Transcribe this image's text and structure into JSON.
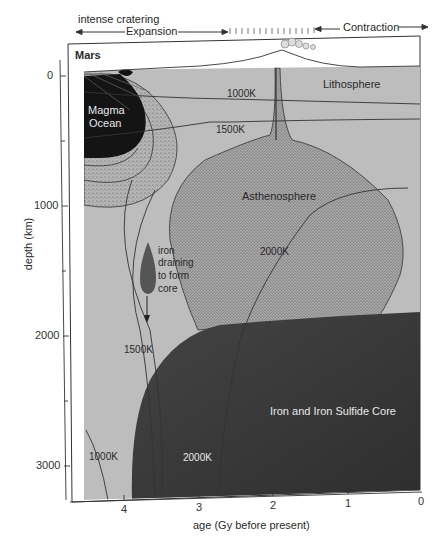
{
  "figure": {
    "title": "Mars",
    "top_annotations": {
      "cratering": "intense cratering",
      "expansion": "Expansion",
      "contraction": "Contraction"
    },
    "regions": {
      "magma_ocean_line1": "Magma",
      "magma_ocean_line2": "Ocean",
      "lithosphere": "Lithosphere",
      "asthenosphere": "Asthenosphere",
      "core": "Iron and Iron Sulfide Core",
      "iron_line1": "iron",
      "iron_line2": "draining",
      "iron_line3": "to form",
      "iron_line4": "core"
    },
    "isotherms": {
      "k1000_top": "1000K",
      "k1500_top": "1500K",
      "k2000_mid": "2000K",
      "k1500_low": "1500K",
      "k1000_low": "1000K",
      "k2000_low": "2000K"
    },
    "y_axis": {
      "label": "depth (km)",
      "ticks": [
        "0",
        "1000",
        "2000",
        "3000"
      ]
    },
    "x_axis": {
      "label": "age (Gy before present)",
      "ticks": [
        "4",
        "3",
        "2",
        "1",
        "0"
      ]
    },
    "colors": {
      "mantle": "#bdbdbd",
      "stipple_region": "#a9a9a9",
      "core": "#3a3a3a",
      "magma_ocean": "#141414",
      "line": "#333333"
    }
  }
}
